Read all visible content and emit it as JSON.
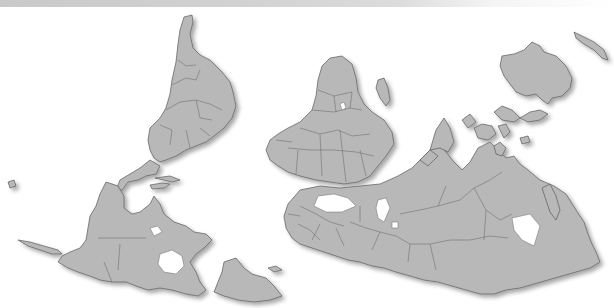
{
  "map": {
    "projection": "south-up world map",
    "colors": {
      "land": "#b8b8b8",
      "border": "#5a5a5a",
      "ocean": "#ffffff",
      "top_bar": "#cfcfcf"
    },
    "regions": [
      {
        "id": "south-america",
        "label": "South America"
      },
      {
        "id": "north-america",
        "label": "North America"
      },
      {
        "id": "greenland",
        "label": "Greenland"
      },
      {
        "id": "africa",
        "label": "Africa"
      },
      {
        "id": "madagascar",
        "label": "Madagascar"
      },
      {
        "id": "europe",
        "label": "Europe"
      },
      {
        "id": "asia",
        "label": "Asia"
      },
      {
        "id": "australia",
        "label": "Australia"
      },
      {
        "id": "new-zealand",
        "label": "New Zealand"
      },
      {
        "id": "southeast-asia",
        "label": "Southeast Asia"
      },
      {
        "id": "japan",
        "label": "Japan"
      }
    ]
  }
}
